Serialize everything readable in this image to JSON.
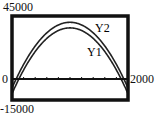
{
  "chart_data": {
    "type": "line",
    "title": "",
    "xlabel": "",
    "ylabel": "",
    "xlim": [
      0,
      2000
    ],
    "ylim": [
      -15000,
      45000
    ],
    "x_tick_step": 200,
    "grid": false,
    "axis_labels": {
      "ymax": "45000",
      "ymin": "-15000",
      "xmin": "0",
      "xmax": "2000"
    },
    "x": [
      0,
      200,
      400,
      600,
      800,
      1000,
      1200,
      1400,
      1600,
      1800,
      2000
    ],
    "series": [
      {
        "name": "Y2",
        "values": [
          -6500,
          10500,
          23500,
          32500,
          38000,
          40500,
          38000,
          32500,
          23500,
          10500,
          -6500
        ]
      },
      {
        "name": "Y1",
        "values": [
          -10500,
          6500,
          19500,
          28500,
          34000,
          36500,
          34000,
          28500,
          19500,
          6500,
          -10500
        ]
      }
    ],
    "annotations": [
      {
        "text": "Y2",
        "near_series": "Y2"
      },
      {
        "text": "Y1",
        "near_series": "Y1"
      }
    ],
    "legend": "inline labels"
  },
  "colors": {
    "frame": "#111111",
    "curve": "#222222",
    "background": "#ffffff"
  }
}
